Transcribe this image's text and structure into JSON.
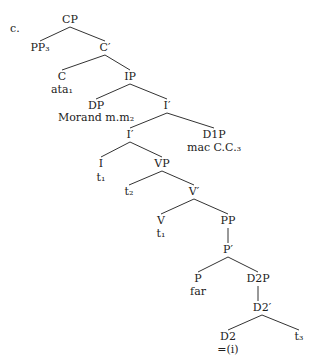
{
  "example_label": "c.",
  "nodes": [
    {
      "id": "CP",
      "text": "CP",
      "x": 70,
      "y": 14
    },
    {
      "id": "PP3",
      "text": "PP₃",
      "x": 40,
      "y": 42
    },
    {
      "id": "Cbar",
      "text": "C′",
      "x": 105,
      "y": 42
    },
    {
      "id": "C",
      "text": "C",
      "x": 62,
      "y": 71
    },
    {
      "id": "ata1",
      "text": "ata₁",
      "x": 62,
      "y": 84
    },
    {
      "id": "IP",
      "text": "IP",
      "x": 130,
      "y": 71
    },
    {
      "id": "DP",
      "text": "DP",
      "x": 96,
      "y": 100
    },
    {
      "id": "morand",
      "text": "Morand m.m₂",
      "x": 96,
      "y": 112
    },
    {
      "id": "Ibar1",
      "text": "I′",
      "x": 167,
      "y": 100
    },
    {
      "id": "Ibar2",
      "text": "I′",
      "x": 130,
      "y": 129
    },
    {
      "id": "D1P",
      "text": "D1P",
      "x": 214,
      "y": 129
    },
    {
      "id": "macCC3",
      "text": "mac C.C.₃",
      "x": 214,
      "y": 142
    },
    {
      "id": "I",
      "text": "I",
      "x": 101,
      "y": 158
    },
    {
      "id": "t1a",
      "text": "t₁",
      "x": 101,
      "y": 172
    },
    {
      "id": "VP",
      "text": "VP",
      "x": 162,
      "y": 158
    },
    {
      "id": "t2",
      "text": "t₂",
      "x": 129,
      "y": 186
    },
    {
      "id": "Vbar",
      "text": "V′",
      "x": 194,
      "y": 186
    },
    {
      "id": "V",
      "text": "V",
      "x": 161,
      "y": 215
    },
    {
      "id": "t1b",
      "text": "t₁",
      "x": 161,
      "y": 228
    },
    {
      "id": "PP",
      "text": "PP",
      "x": 228,
      "y": 215
    },
    {
      "id": "Pbar",
      "text": "P′",
      "x": 228,
      "y": 244
    },
    {
      "id": "P",
      "text": "P",
      "x": 198,
      "y": 273
    },
    {
      "id": "far",
      "text": "far",
      "x": 198,
      "y": 286
    },
    {
      "id": "D2P",
      "text": "D2P",
      "x": 258,
      "y": 273
    },
    {
      "id": "D2bar",
      "text": "D2′",
      "x": 262,
      "y": 302
    },
    {
      "id": "D2",
      "text": "D2",
      "x": 228,
      "y": 331
    },
    {
      "id": "eq_i",
      "text": "=(i)",
      "x": 228,
      "y": 344
    },
    {
      "id": "t3",
      "text": "t₃",
      "x": 299,
      "y": 331
    }
  ],
  "edges": [
    [
      70,
      27,
      40,
      41
    ],
    [
      70,
      27,
      105,
      41
    ],
    [
      105,
      55,
      62,
      70
    ],
    [
      105,
      55,
      130,
      70
    ],
    [
      130,
      84,
      96,
      99
    ],
    [
      130,
      84,
      167,
      99
    ],
    [
      167,
      113,
      130,
      128
    ],
    [
      167,
      113,
      214,
      128
    ],
    [
      130,
      142,
      101,
      157
    ],
    [
      130,
      142,
      162,
      157
    ],
    [
      162,
      171,
      129,
      185
    ],
    [
      162,
      171,
      194,
      185
    ],
    [
      194,
      199,
      161,
      214
    ],
    [
      194,
      199,
      228,
      214
    ],
    [
      228,
      228,
      228,
      243
    ],
    [
      228,
      257,
      198,
      272
    ],
    [
      228,
      257,
      258,
      272
    ],
    [
      258,
      286,
      258,
      301
    ],
    [
      262,
      315,
      228,
      330
    ],
    [
      262,
      315,
      299,
      330
    ]
  ]
}
